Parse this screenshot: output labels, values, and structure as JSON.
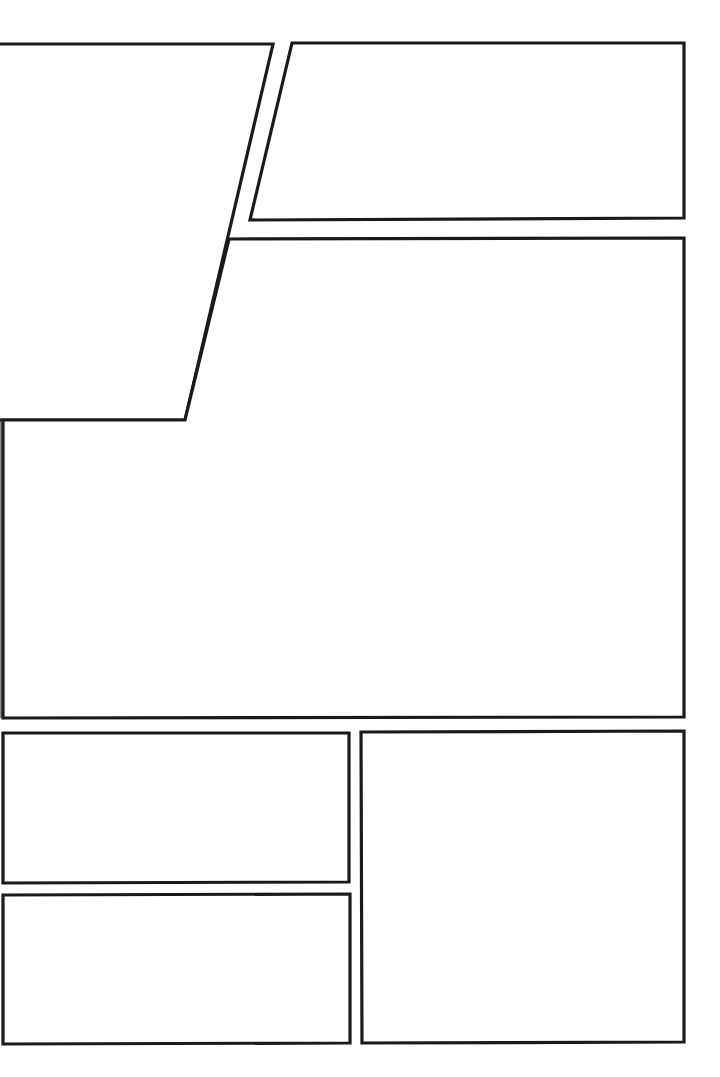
{
  "page": {
    "type": "comic-panel-layout-template",
    "background": "#ffffff",
    "border_color": "#1a1a1a",
    "width": 720,
    "height": 1077
  },
  "panels": [
    {
      "id": "panel-1",
      "shape": "trapezoid",
      "points": "-4,44 273,44 185,420 -4,420",
      "text": ""
    },
    {
      "id": "panel-2",
      "shape": "parallelogram",
      "points": "292,43 684,43 684,218 250,220",
      "text": ""
    },
    {
      "id": "panel-3",
      "shape": "irregular",
      "points": "229,239 684,238 684,717 3,718 3,420 185,420",
      "text": ""
    },
    {
      "id": "panel-4",
      "shape": "rectangle",
      "points": "3,733 349,733 349,882 3,883",
      "text": ""
    },
    {
      "id": "panel-5",
      "shape": "rectangle",
      "points": "3,895 350,894 350,1043 3,1044",
      "text": ""
    },
    {
      "id": "panel-6",
      "shape": "rectangle",
      "points": "361,732 684,731 684,1042 362,1043",
      "text": ""
    }
  ]
}
